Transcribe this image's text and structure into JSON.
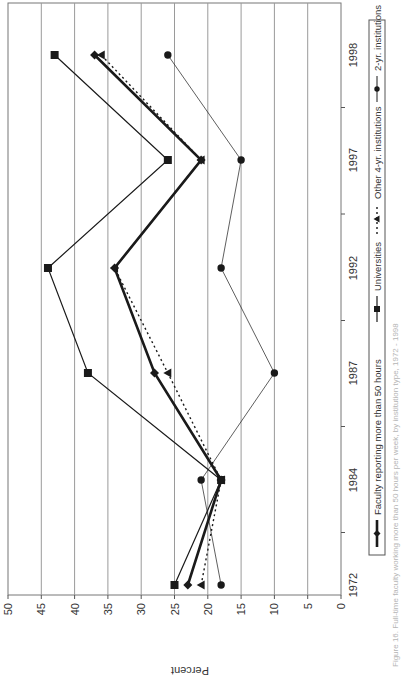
{
  "chart_data": {
    "type": "line",
    "title": "",
    "orientation": "rotated -90deg (page printed landscape)",
    "xlabel": "",
    "ylabel": "Percent",
    "ylim": [
      0,
      50
    ],
    "yticks": [
      0,
      5,
      10,
      15,
      20,
      25,
      30,
      35,
      40,
      45,
      50
    ],
    "grid": true,
    "legend_position": "bottom",
    "categories": [
      "1972",
      "1984",
      "1987",
      "1992",
      "1997",
      "1998"
    ],
    "series": [
      {
        "name": "Faculty reporting more than 50 hours",
        "marker": "diamond",
        "style": "thick-solid",
        "values": [
          23,
          18,
          28,
          34,
          21,
          37
        ]
      },
      {
        "name": "Universities",
        "marker": "square",
        "style": "solid",
        "values": [
          25,
          18,
          38,
          44,
          26,
          43
        ]
      },
      {
        "name": "Other 4-yr. institutions",
        "marker": "triangle",
        "style": "dotted",
        "values": [
          21,
          18,
          26,
          34,
          21,
          36
        ]
      },
      {
        "name": "2-yr. institutions",
        "marker": "circle",
        "style": "thin-solid",
        "values": [
          18,
          21,
          10,
          18,
          15,
          26
        ]
      }
    ],
    "caption": "Figure 16. Full-time faculty working more than 50 hours per week, by institution type, 1972 - 1998"
  },
  "axis": {
    "ylabel": "Percent",
    "yticks": [
      "0",
      "5",
      "10",
      "15",
      "20",
      "25",
      "30",
      "35",
      "40",
      "45",
      "50"
    ],
    "xticks": [
      "1972",
      "1984",
      "1987",
      "1992",
      "1997",
      "1998"
    ]
  },
  "legend": {
    "items": [
      {
        "label": "Faculty reporting more than 50 hours"
      },
      {
        "label": "Universities"
      },
      {
        "label": "Other 4-yr. institutions"
      },
      {
        "label": "2-yr. institutions"
      }
    ]
  },
  "caption": "Figure 16. Full-time faculty working more than 50 hours per week, by institution type, 1972 - 1998",
  "colors": {
    "series": "#1a1a1a",
    "grid": "#9a9a9a",
    "axis": "#555555",
    "caption": "#b5b5b5"
  }
}
